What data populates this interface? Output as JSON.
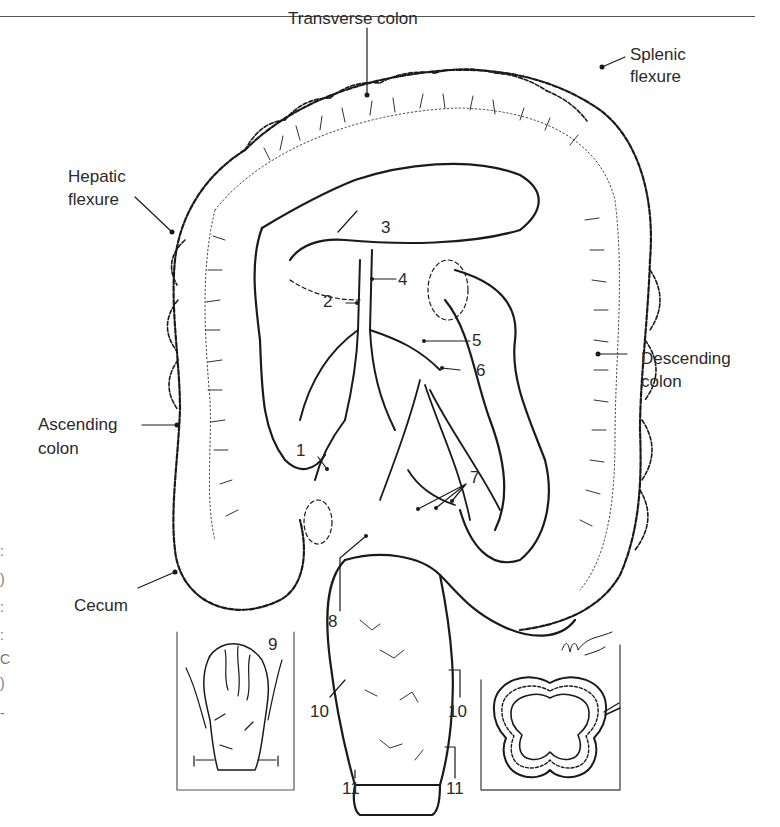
{
  "figure": {
    "region_labels": {
      "transverse_colon": "Transverse colon",
      "splenic_flexure_line1": "Splenic",
      "splenic_flexure_line2": "flexure",
      "hepatic_flexure_line1": "Hepatic",
      "hepatic_flexure_line2": "flexure",
      "descending_colon_line1": "Descending",
      "descending_colon_line2": "colon",
      "ascending_colon_line1": "Ascending",
      "ascending_colon_line2": "colon",
      "cecum": "Cecum"
    },
    "callouts": [
      {
        "id": "1",
        "label": "1"
      },
      {
        "id": "2",
        "label": "2"
      },
      {
        "id": "3",
        "label": "3"
      },
      {
        "id": "4",
        "label": "4"
      },
      {
        "id": "5",
        "label": "5"
      },
      {
        "id": "6",
        "label": "6"
      },
      {
        "id": "7",
        "label": "7"
      },
      {
        "id": "8",
        "label": "8"
      },
      {
        "id": "9",
        "label": "9"
      },
      {
        "id": "10a",
        "label": "10"
      },
      {
        "id": "10b",
        "label": "10"
      },
      {
        "id": "11a",
        "label": "11"
      },
      {
        "id": "11b",
        "label": "11"
      }
    ],
    "insets": [
      {
        "name": "rectum-posterior-view"
      },
      {
        "name": "colon-cross-section"
      }
    ],
    "edge_glyphs": [
      ":",
      ")",
      ":",
      ":",
      "C",
      ")",
      "-"
    ]
  }
}
